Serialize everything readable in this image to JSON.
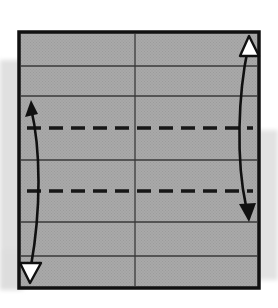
{
  "figure": {
    "kind": "origami-fold-diagram",
    "canvas": {
      "width": 278,
      "height": 308
    },
    "background_color": "#ffffff",
    "scan_shadow": {
      "color": "#d8d8d8",
      "opacity": 0.75,
      "left_band": {
        "x": 0,
        "y": 60,
        "width": 22,
        "height": 230
      },
      "right_band": {
        "x": 258,
        "y": 130,
        "width": 20,
        "height": 150
      }
    },
    "paper": {
      "name": "square-sheet",
      "fill_color": "#a8a8a8",
      "texture_color": "#9a9a9a",
      "border_color": "#111111",
      "border_width": 3.5,
      "x": 19,
      "y": 32,
      "width": 240,
      "height": 256
    },
    "vertical_center_line": {
      "name": "vertical-center-crease",
      "x": 135,
      "y1": 32,
      "y2": 288,
      "color": "#3a3a3a",
      "width": 1.3,
      "style": "solid"
    },
    "horizontal_solid_creases": [
      {
        "label": "crease-1",
        "y": 66,
        "color": "#3a3a3a",
        "width": 1.3
      },
      {
        "label": "crease-2",
        "y": 96,
        "color": "#3a3a3a",
        "width": 1.3
      },
      {
        "label": "crease-3",
        "y": 160,
        "color": "#3a3a3a",
        "width": 1.3
      },
      {
        "label": "crease-4",
        "y": 222,
        "color": "#3a3a3a",
        "width": 1.3
      },
      {
        "label": "crease-5",
        "y": 256,
        "color": "#3a3a3a",
        "width": 1.3
      }
    ],
    "horizontal_dashed_creases": [
      {
        "label": "fold-line-upper",
        "y": 128,
        "color": "#171717",
        "width": 3.4,
        "dash": "14 8",
        "x1": 27,
        "x2": 253
      },
      {
        "label": "fold-line-lower",
        "y": 191,
        "color": "#171717",
        "width": 3.4,
        "dash": "14 8",
        "x1": 27,
        "x2": 253
      }
    ],
    "arrows": [
      {
        "name": "left-fold-arrow",
        "stroke_color": "#101010",
        "stroke_width": 2.6,
        "path": "M 31 108 C 41 150, 41 210, 31 266",
        "head_start": {
          "type": "solid",
          "fill": "#101010",
          "points": "31,100 25,117 38,114",
          "direction": "up"
        },
        "head_end": {
          "type": "hollow",
          "fill": "#ffffff",
          "stroke": "#101010",
          "points": "30,283 20,263 41,263",
          "direction": "down"
        }
      },
      {
        "name": "right-fold-arrow",
        "stroke_color": "#101010",
        "stroke_width": 2.6,
        "path": "M 248 48 C 238 95, 236 160, 246 206",
        "head_start": {
          "type": "hollow",
          "fill": "#ffffff",
          "stroke": "#101010",
          "points": "249,36 240,56 259,56",
          "direction": "up"
        },
        "head_end": {
          "type": "solid",
          "fill": "#101010",
          "points": "249,222 239,204 256,203",
          "direction": "down"
        }
      }
    ]
  }
}
